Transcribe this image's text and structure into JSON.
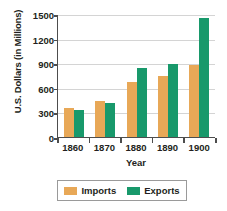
{
  "chart_data": {
    "type": "bar",
    "title": "",
    "xlabel": "Year",
    "ylabel": "U.S. Dollars (in Millions)",
    "categories": [
      "1860",
      "1870",
      "1880",
      "1890",
      "1900"
    ],
    "series": [
      {
        "name": "Imports",
        "color": "#e8a857",
        "values": [
          355,
          445,
          675,
          750,
          880
        ]
      },
      {
        "name": "Exports",
        "color": "#18996b",
        "values": [
          335,
          410,
          845,
          890,
          1450
        ]
      }
    ],
    "ylim": [
      0,
      1500
    ],
    "yticks": [
      0,
      300,
      600,
      900,
      1200,
      1500
    ],
    "ytick_labels": [
      "0",
      "300",
      "600",
      "900",
      "1200",
      "1500"
    ],
    "grid": true,
    "legend_position": "bottom"
  },
  "legend": {
    "entries": [
      {
        "label": "Imports",
        "swatch": "imports-swatch"
      },
      {
        "label": "Exports",
        "swatch": "exports-swatch"
      }
    ]
  },
  "colors": {
    "imports": "#e8a857",
    "exports": "#18996b",
    "axis": "#4d4d4d",
    "gridline": "#d4d4d4",
    "text": "#231f20",
    "background": "#ffffff"
  }
}
